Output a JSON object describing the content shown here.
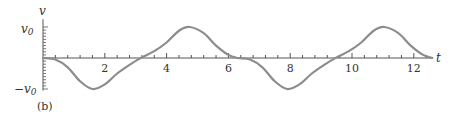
{
  "chart_data": {
    "type": "line",
    "title": "",
    "panel_label": "(b)",
    "xlabel": "t",
    "ylabel": "v",
    "xlim": [
      0,
      12.6
    ],
    "ylim": [
      -1,
      1
    ],
    "x_ticks": [
      2,
      4,
      6,
      8,
      10,
      12
    ],
    "x_tick_labels": [
      "2",
      "4",
      "6",
      "8",
      "10",
      "12"
    ],
    "minor_x_tick_step": 0.4,
    "y_tick_labels": [
      "v0",
      "-v0"
    ],
    "y_tick_values": [
      1,
      -1
    ],
    "grid": false,
    "legend": null,
    "series": [
      {
        "name": "v(t)",
        "color": "#8c8c8c",
        "x": [
          0,
          0.4,
          0.8,
          1.2,
          1.6,
          2.0,
          2.4,
          2.8,
          3.2,
          3.6,
          4.0,
          4.4,
          4.75,
          5.2,
          5.6,
          6.0,
          6.3,
          6.7,
          7.1,
          7.5,
          7.9,
          8.3,
          8.7,
          9.1,
          9.5,
          9.9,
          10.3,
          10.7,
          11.05,
          11.5,
          11.9,
          12.3,
          12.6
        ],
        "values": [
          0,
          -0.05,
          -0.3,
          -0.75,
          -1.0,
          -0.85,
          -0.5,
          -0.22,
          0.02,
          0.22,
          0.5,
          0.88,
          1.0,
          0.8,
          0.4,
          0.1,
          0,
          -0.05,
          -0.3,
          -0.75,
          -1.0,
          -0.85,
          -0.5,
          -0.22,
          0.02,
          0.22,
          0.5,
          0.88,
          1.0,
          0.8,
          0.4,
          0.1,
          0
        ]
      }
    ]
  },
  "labels": {
    "y_axis": "v",
    "x_axis": "t",
    "v0_pos": "v",
    "v0_sub": "0",
    "v0_neg_sign": "−",
    "panel": "(b)"
  }
}
